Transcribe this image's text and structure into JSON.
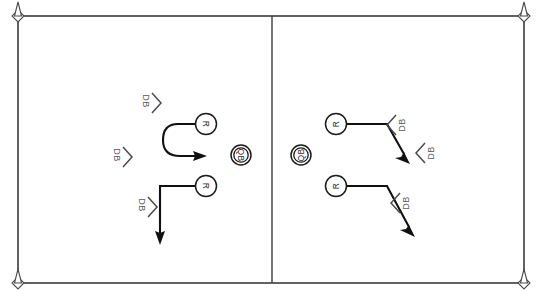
{
  "diagram": {
    "field": {
      "border_color": "#3b3b3b",
      "background_color": "#ffffff",
      "divider_label": "center-divider"
    },
    "pylons": [
      {
        "name": "pylon-top-left",
        "x": 18,
        "y": 16
      },
      {
        "name": "pylon-top-right",
        "x": 524,
        "y": 16
      },
      {
        "name": "pylon-bottom-left",
        "x": 18,
        "y": 283
      },
      {
        "name": "pylon-bottom-right",
        "x": 524,
        "y": 283
      }
    ],
    "left_play": {
      "name": "left-play",
      "receivers": [
        {
          "label": "R",
          "x": 206,
          "y": 124,
          "route": "hook-curl"
        },
        {
          "label": "R",
          "x": 206,
          "y": 186,
          "route": "out-and-go-down"
        }
      ],
      "quarterback": {
        "label": "QB",
        "x": 241,
        "y": 155
      },
      "defenders": [
        {
          "label": "DB",
          "x": 146,
          "y": 101
        },
        {
          "label": "DB",
          "x": 117,
          "y": 155
        },
        {
          "label": "DB",
          "x": 142,
          "y": 205
        }
      ]
    },
    "right_play": {
      "name": "right-play",
      "receivers": [
        {
          "label": "R",
          "x": 336,
          "y": 124,
          "route": "out-and-break-down"
        },
        {
          "label": "R",
          "x": 336,
          "y": 186,
          "route": "out-and-break-down"
        }
      ],
      "quarterback": {
        "label": "QB",
        "x": 301,
        "y": 155
      },
      "defenders": [
        {
          "label": "DB",
          "x": 399,
          "y": 125
        },
        {
          "label": "DB",
          "x": 428,
          "y": 153
        },
        {
          "label": "DB",
          "x": 403,
          "y": 203
        }
      ]
    },
    "legend": {
      "receiver_symbol": "R",
      "quarterback_symbol": "QB",
      "defender_symbol": "DB"
    }
  }
}
